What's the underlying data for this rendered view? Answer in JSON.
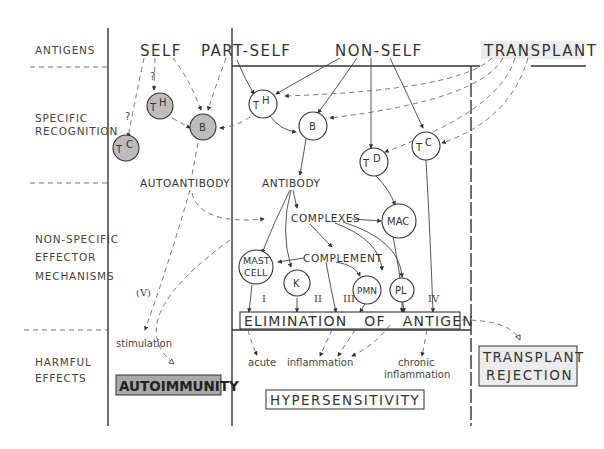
{
  "rows": [
    {
      "id": "antigens",
      "label": "ANTIGENS"
    },
    {
      "id": "specific",
      "label": [
        "SPECIFIC",
        "RECOGNITION"
      ]
    },
    {
      "id": "nonspecific",
      "label": [
        "NON-SPECIFIC",
        "EFFECTOR",
        "MECHANISMS"
      ]
    },
    {
      "id": "harmful",
      "label": [
        "HARMFUL",
        "EFFECTS"
      ]
    }
  ],
  "antigens": {
    "self": "SELF",
    "part_self": "PART-SELF",
    "non_self": "NON-SELF",
    "transplant": "TRANSPLANT"
  },
  "cells": {
    "self_th": {
      "main": "T",
      "sub": "H"
    },
    "self_tc": {
      "main": "T",
      "sub": "C"
    },
    "self_b": "B",
    "th": {
      "main": "T",
      "sub": "H"
    },
    "b": "B",
    "td": {
      "main": "T",
      "sub": "D"
    },
    "tc": {
      "main": "T",
      "sub": "C"
    },
    "mac": "MAC",
    "mast": [
      "MAST",
      "CELL"
    ],
    "k": "K",
    "pmn": "PMN",
    "pl": "PL"
  },
  "labels": {
    "question": "?",
    "autoantibody": "AUTOANTIBODY",
    "antibody": "ANTIBODY",
    "complexes": "COMPLEXES",
    "complement": "COMPLEMENT",
    "type_v": "(V)",
    "type_i": "I",
    "type_ii": "II",
    "type_iii": "III",
    "type_iv": "IV",
    "elimination": "ELIMINATION   OF   ANTIGEN",
    "stimulation": "stimulation",
    "acute": "acute",
    "inflammation": "inflammation",
    "chronic": [
      "chronic",
      "inflammation"
    ]
  },
  "outcomes": {
    "autoimmunity": "AUTOIMMUNITY",
    "hypersensitivity": "HYPERSENSITIVITY",
    "transplant_rejection": [
      "TRANSPLANT",
      "REJECTION"
    ]
  },
  "colors": {
    "ink": "#333333",
    "grey_fill": "#bdbdbd",
    "autoimmunity_fill": "#a9a9a9",
    "light_box": "#ececec"
  }
}
